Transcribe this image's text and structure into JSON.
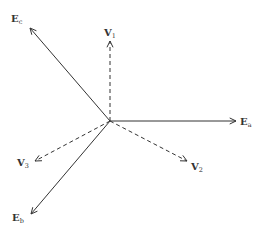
{
  "diagram": {
    "origin": [
      110,
      121
    ],
    "line_color": "#333333",
    "vectors": [
      {
        "id": "Ea",
        "label": "E",
        "sub": "a",
        "style": "solid",
        "tip": [
          236,
          121
        ],
        "label_pos": [
          240,
          125
        ]
      },
      {
        "id": "Ec",
        "label": "E",
        "sub": "c",
        "style": "solid",
        "tip": [
          30,
          28
        ],
        "label_pos": [
          11,
          22
        ]
      },
      {
        "id": "Eb",
        "label": "E",
        "sub": "b",
        "style": "solid",
        "tip": [
          31,
          214
        ],
        "label_pos": [
          12,
          221
        ]
      },
      {
        "id": "V1",
        "label": "V",
        "sub": "1",
        "style": "dashed",
        "tip": [
          110,
          41
        ],
        "label_pos": [
          104,
          36
        ]
      },
      {
        "id": "V2",
        "label": "V",
        "sub": "2",
        "style": "dashed",
        "tip": [
          187,
          161
        ],
        "label_pos": [
          191,
          170
        ]
      },
      {
        "id": "V3",
        "label": "V",
        "sub": "3",
        "style": "dashed",
        "tip": [
          35,
          161
        ],
        "label_pos": [
          17,
          166
        ]
      }
    ]
  }
}
